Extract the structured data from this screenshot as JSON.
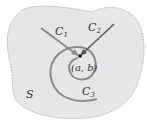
{
  "diagram": {
    "region_label": "S",
    "point_label": "(a, b)",
    "curves": [
      {
        "name": "C",
        "sub": "1",
        "color": "#8a8a8a"
      },
      {
        "name": "C",
        "sub": "2",
        "color": "#555555"
      },
      {
        "name": "C",
        "sub": "3",
        "color": "#8a8a8a"
      }
    ],
    "colors": {
      "region_fill": "#e6e6e6",
      "region_border": "#9a9a9a",
      "point": "#111111"
    }
  }
}
